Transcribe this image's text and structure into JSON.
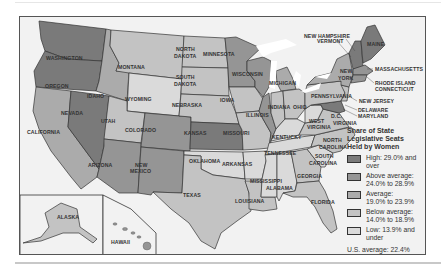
{
  "title": "Share of State Legislative Seats Held by Women",
  "legend": {
    "title_lines": [
      "Share of State",
      "Legislative Seats",
      "Held by Women"
    ],
    "items": [
      {
        "label_lines": [
          "High: 29.0% and",
          "over"
        ],
        "color": "#7a7a7a"
      },
      {
        "label_lines": [
          "Above average:",
          "24.0% to 28.9%"
        ],
        "color": "#959595"
      },
      {
        "label_lines": [
          "Average:",
          "19.0% to 23.9%"
        ],
        "color": "#ababab"
      },
      {
        "label_lines": [
          "Below average:",
          "14.0% to 18.9%"
        ],
        "color": "#c3c3c3"
      },
      {
        "label_lines": [
          "Low: 13.9% and",
          "under"
        ],
        "color": "#dadada"
      }
    ],
    "us_average": "U.S. average: 22.4%"
  },
  "states": {
    "washington": "WASHINGTON",
    "oregon": "OREGON",
    "california": "CALIFORNIA",
    "nevada": "NEVADA",
    "idaho": "IDAHO",
    "montana": "MONTANA",
    "wyoming": "WYOMING",
    "utah": "UTAH",
    "arizona": "ARIZONA",
    "colorado": "COLORADO",
    "new_mexico_1": "NEW",
    "new_mexico_2": "MEXICO",
    "north_dakota_1": "NORTH",
    "north_dakota_2": "DAKOTA",
    "south_dakota_1": "SOUTH",
    "south_dakota_2": "DAKOTA",
    "nebraska": "NEBRASKA",
    "kansas": "KANSAS",
    "oklahoma": "OKLAHOMA",
    "texas": "TEXAS",
    "minnesota": "MINNESOTA",
    "iowa": "IOWA",
    "missouri": "MISSOURI",
    "arkansas": "ARKANSAS",
    "louisiana": "LOUISIANA",
    "wisconsin": "WISCONSIN",
    "illinois": "ILLINOIS",
    "michigan": "MICHIGAN",
    "indiana": "INDIANA",
    "ohio": "OHIO",
    "kentucky": "KENTUCKY",
    "tennessee": "TENNESSEE",
    "mississippi": "MISSISSIPPI",
    "alabama": "ALABAMA",
    "georgia": "GEORGIA",
    "florida": "FLORIDA",
    "south_carolina_1": "SOUTH",
    "south_carolina_2": "CAROLINA",
    "north_carolina_1": "NORTH",
    "north_carolina_2": "CAROLINA",
    "virginia": "VIRGINIA",
    "west_virginia_1": "WEST",
    "west_virginia_2": "VIRGINIA",
    "dc": "D.C.",
    "pennsylvania": "PENNSYLVANIA",
    "new_york_1": "NEW",
    "new_york_2": "YORK",
    "new_jersey": "NEW JERSEY",
    "delaware": "DELAWARE",
    "maryland": "MARYLAND",
    "nh_vt_1": "NEW HAMPSHIRE",
    "nh_vt_2": "VERMONT",
    "maine": "MAINE",
    "massachusetts": "MASSACHUSETTS",
    "ri_ct_1": "RHODE ISLAND",
    "ri_ct_2": "CONNECTICUT",
    "alaska": "ALASKA",
    "hawaii": "HAWAII"
  }
}
